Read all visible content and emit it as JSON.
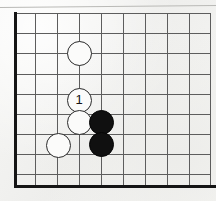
{
  "figure": {
    "kind": "go-board-diagram",
    "width": 216,
    "height": 201,
    "background_color": "#f4f4f2",
    "paper_artifact": {
      "name": "scan-line-top",
      "description": "thin slanted horizontal scan line across top of page"
    }
  },
  "board": {
    "line_color": "#5d5d5d",
    "border_color": "#151515",
    "columns": 10,
    "rows": 10,
    "vertical_lines_x": [
      15,
      35,
      57,
      79,
      101,
      123,
      145,
      167,
      189,
      210
    ],
    "horizontal_lines_y": [
      13,
      33,
      53,
      74,
      94,
      114,
      134,
      154,
      174,
      186
    ],
    "left_border": {
      "x": 15,
      "y_top": 12,
      "y_bottom": 188,
      "thickness": 3
    },
    "bottom_border": {
      "y": 185,
      "x_left": 14,
      "x_right": 216,
      "thickness": 3
    }
  },
  "stones": [
    {
      "id": "stone-white-a",
      "color": "white",
      "color_hex": "#fbfbfa",
      "cx": 79,
      "cy": 53,
      "radius": 12.5,
      "label": ""
    },
    {
      "id": "stone-white-move-1",
      "color": "white",
      "color_hex": "#fbfbfa",
      "cx": 79,
      "cy": 100,
      "radius": 12.5,
      "label": "1"
    },
    {
      "id": "stone-white-b",
      "color": "white",
      "color_hex": "#fbfbfa",
      "cx": 79,
      "cy": 122,
      "radius": 12.5,
      "label": ""
    },
    {
      "id": "stone-white-c",
      "color": "white",
      "color_hex": "#fbfbfa",
      "cx": 58,
      "cy": 145,
      "radius": 12.5,
      "label": ""
    },
    {
      "id": "stone-black-a",
      "color": "black",
      "color_hex": "#101010",
      "cx": 101,
      "cy": 122,
      "radius": 12.5,
      "label": ""
    },
    {
      "id": "stone-black-b",
      "color": "black",
      "color_hex": "#101010",
      "cx": 101,
      "cy": 144,
      "radius": 12.5,
      "label": ""
    }
  ],
  "move_numbers": [
    "1"
  ]
}
